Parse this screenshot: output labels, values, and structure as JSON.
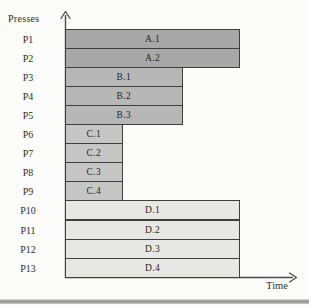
{
  "figure": {
    "background": "#fcfcfa",
    "text_color": "#2e2e2e",
    "axis_color": "#4a4a4a",
    "bar_border_color": "#3e3e3e"
  },
  "chart_data": {
    "type": "bar",
    "orientation": "horizontal",
    "title": "",
    "xlabel": "Time",
    "ylabel": "Presses",
    "x_axis": {
      "numeric_ticks": false,
      "arrow": true,
      "note": "unlabeled relative time axis"
    },
    "y_axis": {
      "arrow": true
    },
    "categories": [
      "P1",
      "P2",
      "P3",
      "P4",
      "P5",
      "P6",
      "P7",
      "P8",
      "P9",
      "P10",
      "P11",
      "P12",
      "P13"
    ],
    "bars": [
      {
        "press": "P1",
        "job": "A.1",
        "duration_rel": 3,
        "group": "A"
      },
      {
        "press": "P2",
        "job": "A.2",
        "duration_rel": 3,
        "group": "A"
      },
      {
        "press": "P3",
        "job": "B.1",
        "duration_rel": 2,
        "group": "B"
      },
      {
        "press": "P4",
        "job": "B.2",
        "duration_rel": 2,
        "group": "B"
      },
      {
        "press": "P5",
        "job": "B.3",
        "duration_rel": 2,
        "group": "B"
      },
      {
        "press": "P6",
        "job": "C.1",
        "duration_rel": 1,
        "group": "C"
      },
      {
        "press": "P7",
        "job": "C.2",
        "duration_rel": 1,
        "group": "C"
      },
      {
        "press": "P8",
        "job": "C.3",
        "duration_rel": 1,
        "group": "C"
      },
      {
        "press": "P9",
        "job": "C.4",
        "duration_rel": 1,
        "group": "C"
      },
      {
        "press": "P10",
        "job": "D.1",
        "duration_rel": 3,
        "group": "D"
      },
      {
        "press": "P11",
        "job": "D.2",
        "duration_rel": 3,
        "group": "D"
      },
      {
        "press": "P12",
        "job": "D.3",
        "duration_rel": 3,
        "group": "D"
      },
      {
        "press": "P13",
        "job": "D.4",
        "duration_rel": 3,
        "group": "D"
      }
    ],
    "groups": {
      "A": {
        "fill": "#a8a8a8",
        "width_px": 175
      },
      "B": {
        "fill": "#b7b7b7",
        "width_px": 117.5
      },
      "C": {
        "fill": "#c6c6c6",
        "width_px": 57.5
      },
      "D": {
        "fill": "#e7e7e3",
        "width_px": 175
      }
    },
    "legend": null,
    "grid": false
  }
}
